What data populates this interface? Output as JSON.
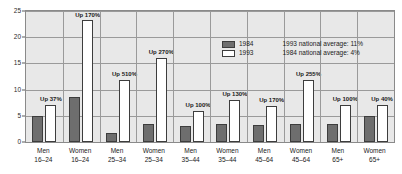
{
  "chart_data": {
    "type": "bar",
    "title": "",
    "subtitle": "",
    "xlabel": "",
    "ylabel": "",
    "ylim": [
      0,
      25
    ],
    "yticks": [
      0,
      5,
      10,
      15,
      20,
      25
    ],
    "ytick_labels": [
      "0",
      "5",
      "10",
      "15",
      "20",
      "25"
    ],
    "grid": true,
    "legend_position": "inside-top-right",
    "categories": [
      "Men 16–24",
      "Women 16–24",
      "Men 25–34",
      "Women 25–34",
      "Men 35–44",
      "Women 35–44",
      "Men 45–64",
      "Women 45–64",
      "Men 65+",
      "Women 65+"
    ],
    "category_lines": [
      [
        "Men",
        "16–24"
      ],
      [
        "Women",
        "16–24"
      ],
      [
        "Men",
        "25–34"
      ],
      [
        "Women",
        "25–34"
      ],
      [
        "Men",
        "35–44"
      ],
      [
        "Women",
        "35–44"
      ],
      [
        "Men",
        "45–64"
      ],
      [
        "Women",
        "45–64"
      ],
      [
        "Men",
        "65+"
      ],
      [
        "Women",
        "65+"
      ]
    ],
    "series": [
      {
        "name": "1984",
        "color": "#6e6e6e",
        "values": [
          5.0,
          8.5,
          1.8,
          3.5,
          3.0,
          3.5,
          3.2,
          3.5,
          3.5,
          5.0
        ]
      },
      {
        "name": "1993",
        "color": "#ffffff",
        "values": [
          7.0,
          23.2,
          11.8,
          16.0,
          6.0,
          8.0,
          6.8,
          11.8,
          7.0,
          7.0
        ]
      }
    ],
    "annotations": [
      "Up 37%",
      "Up 170%",
      "Up 510%",
      "Up 270%",
      "Up 100%",
      "Up 130%",
      "Up 170%",
      "Up 255%",
      "Up 100%",
      "Up 40%"
    ],
    "notes": [
      "1993 national average: 11%",
      "1984 national average: 4%"
    ]
  },
  "legend": {
    "entries": [
      {
        "label": "1984"
      },
      {
        "label": "1993"
      }
    ]
  }
}
